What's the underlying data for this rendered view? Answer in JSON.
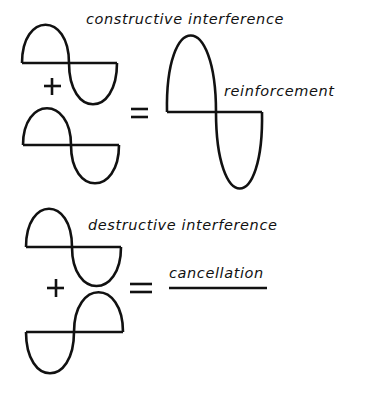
{
  "diagram": {
    "constructive": {
      "title": "constructive interference",
      "result_label": "reinforcement",
      "operator_plus": "+",
      "operator_equals": "="
    },
    "destructive": {
      "title": "destructive interference",
      "result_label": "cancellation",
      "operator_plus": "+",
      "operator_equals": "="
    },
    "stroke_color": "#111111",
    "background": "#ffffff"
  }
}
